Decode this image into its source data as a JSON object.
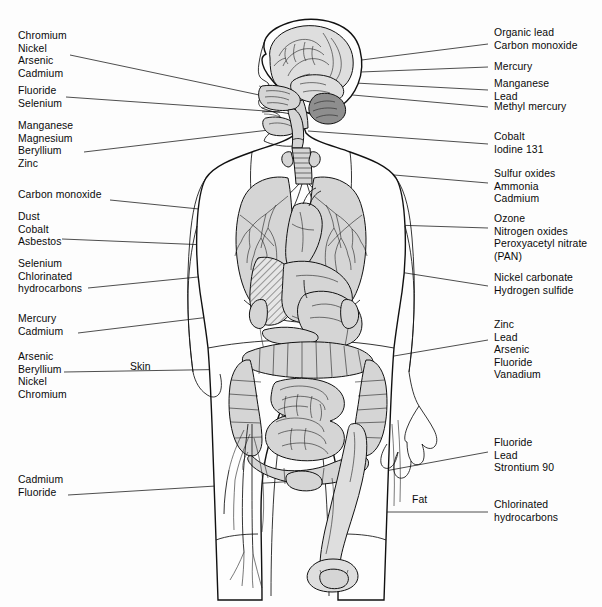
{
  "figure": {
    "background_color": "#fdfdfd",
    "line_color": "#111111",
    "label_color": "#0a0a0a",
    "organ_fill_color": "#d5d5d5",
    "cerebellum_fill_color": "#8e8e8e"
  },
  "labels_left": [
    {
      "id": "nose-sinus",
      "target": "nasal cavity / sinus",
      "lines": [
        "Chromium",
        "Nickel",
        "Arsenic",
        "Cadmium"
      ],
      "x": 18,
      "y": 30
    },
    {
      "id": "teeth-mouth",
      "target": "teeth / oral cavity",
      "lines": [
        "Fluoride",
        "Selenium"
      ],
      "x": 18,
      "y": 85
    },
    {
      "id": "trachea-bronchi",
      "target": "trachea and bronchi",
      "lines": [
        "Manganese",
        "Magnesium",
        "Beryllium",
        "Zinc"
      ],
      "x": 18,
      "y": 120
    },
    {
      "id": "blood-heart",
      "target": "heart and blood",
      "lines": [
        "Carbon monoxide"
      ],
      "x": 18,
      "y": 195
    },
    {
      "id": "lung-left",
      "target": "left lung",
      "lines": [
        "Dust",
        "Cobalt",
        "Asbestos"
      ],
      "x": 18,
      "y": 213
    },
    {
      "id": "liver",
      "target": "liver",
      "lines": [
        "Selenium",
        "Chlorinated",
        "hydrocarbons"
      ],
      "x": 18,
      "y": 262
    },
    {
      "id": "kidney-left",
      "target": "kidney",
      "lines": [
        "Mercury",
        "Cadmium"
      ],
      "x": 18,
      "y": 316
    },
    {
      "id": "skin",
      "target": "skin",
      "lines": [
        "Arsenic",
        "Beryllium",
        "Nickel",
        "Chromium"
      ],
      "x": 18,
      "y": 354
    },
    {
      "id": "bone-left",
      "target": "bone",
      "lines": [
        "Cadmium",
        "Fluoride"
      ],
      "x": 18,
      "y": 476
    }
  ],
  "labels_right": [
    {
      "id": "brain-cerebrum",
      "target": "cerebrum",
      "lines": [
        "Organic lead",
        "Carbon monoxide"
      ],
      "x": 494,
      "y": 27
    },
    {
      "id": "brain-mid",
      "target": "brain",
      "lines": [
        "Mercury"
      ],
      "x": 494,
      "y": 62
    },
    {
      "id": "brain-lower",
      "target": "brain (basal ganglia)",
      "lines": [
        "Manganese",
        "Lead"
      ],
      "x": 494,
      "y": 79
    },
    {
      "id": "cerebellum",
      "target": "cerebellum",
      "lines": [
        "Methyl mercury"
      ],
      "x": 494,
      "y": 104
    },
    {
      "id": "thyroid",
      "target": "thyroid gland",
      "lines": [
        "Cobalt",
        "Iodine 131"
      ],
      "x": 494,
      "y": 131
    },
    {
      "id": "upper-airway",
      "target": "upper respiratory tract",
      "lines": [
        "Sulfur oxides",
        "Ammonia",
        "Cadmium"
      ],
      "x": 494,
      "y": 169
    },
    {
      "id": "lower-airway",
      "target": "lower respiratory tract",
      "lines": [
        "Ozone",
        "Nitrogen oxides",
        "Peroxyacetyl nitrate",
        "(PAN)"
      ],
      "x": 494,
      "y": 214
    },
    {
      "id": "lung-right",
      "target": "right lung",
      "lines": [
        "Nickel carbonate",
        "Hydrogen sulfide"
      ],
      "x": 494,
      "y": 273
    },
    {
      "id": "intestine",
      "target": "intestinal tract",
      "lines": [
        "Zinc",
        "Lead",
        "Arsenic",
        "Fluoride",
        "Vanadium"
      ],
      "x": 494,
      "y": 321
    },
    {
      "id": "bone-right",
      "target": "bone",
      "lines": [
        "Fluoride",
        "Lead",
        "Strontium 90"
      ],
      "x": 494,
      "y": 438
    },
    {
      "id": "fat-tissue",
      "target": "fat tissue",
      "lines": [
        "Chlorinated",
        "hydrocarbons"
      ],
      "x": 494,
      "y": 500
    }
  ],
  "labels_inline": [
    {
      "id": "skin-callout",
      "text": "Skin",
      "x": 130,
      "y": 362
    },
    {
      "id": "fat-callout",
      "text": "Fat",
      "x": 412,
      "y": 495
    }
  ]
}
